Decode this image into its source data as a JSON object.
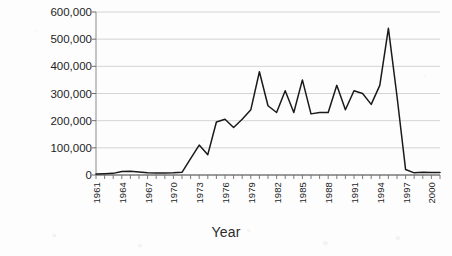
{
  "chart_data": {
    "type": "line",
    "title": "",
    "xlabel": "Year",
    "ylabel": "Metric Ton",
    "ylim": [
      0,
      600000
    ],
    "xlim": [
      1961,
      2001
    ],
    "grid": true,
    "legend": false,
    "legend_position": "none",
    "line_color": "#1a1a1a",
    "y_ticks": [
      0,
      100000,
      200000,
      300000,
      400000,
      500000,
      600000
    ],
    "y_tick_labels": [
      "0",
      "100,000",
      "200,000",
      "300,000",
      "400,000",
      "500,000",
      "600,000"
    ],
    "x_tick_labels": [
      "1961",
      "1964",
      "1967",
      "1970",
      "1973",
      "1976",
      "1979",
      "1982",
      "1985",
      "1988",
      "1991",
      "1994",
      "1997",
      "2000"
    ],
    "x": [
      1961,
      1962,
      1963,
      1964,
      1965,
      1966,
      1967,
      1968,
      1969,
      1970,
      1971,
      1972,
      1973,
      1974,
      1975,
      1976,
      1977,
      1978,
      1979,
      1980,
      1981,
      1982,
      1983,
      1984,
      1985,
      1986,
      1987,
      1988,
      1989,
      1990,
      1991,
      1992,
      1993,
      1994,
      1995,
      1996,
      1997,
      1998,
      1999,
      2000,
      2001
    ],
    "values": [
      4000,
      5000,
      6000,
      13000,
      14000,
      11000,
      8000,
      7000,
      7000,
      8000,
      10000,
      60000,
      110000,
      75000,
      195000,
      205000,
      175000,
      205000,
      240000,
      380000,
      255000,
      230000,
      310000,
      230000,
      350000,
      225000,
      230000,
      230000,
      330000,
      240000,
      310000,
      300000,
      260000,
      330000,
      540000,
      290000,
      20000,
      8000,
      10000,
      9000,
      9000
    ],
    "series_name": "Production"
  },
  "axis": {
    "ylabel": "Metric Ton",
    "xlabel": "Year"
  }
}
